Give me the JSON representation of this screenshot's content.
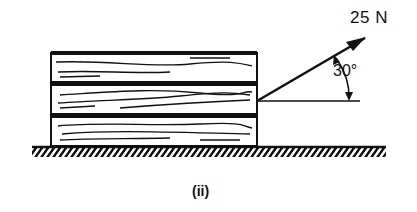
{
  "diagram": {
    "force_label": "25 N",
    "angle_label": "30°",
    "caption": "(ii)",
    "planks_count": 3,
    "force": {
      "magnitude": 25,
      "unit": "N",
      "angle_deg": 30
    },
    "colors": {
      "ink": "#111111",
      "background": "#ffffff"
    }
  }
}
